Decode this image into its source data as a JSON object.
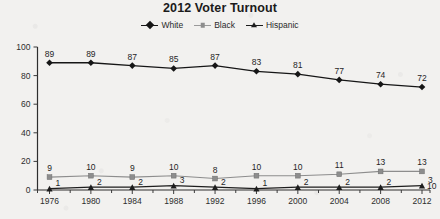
{
  "chart_data": {
    "type": "line",
    "title": "2012 Voter Turnout",
    "xlabel": "",
    "ylabel": "",
    "ylim": [
      0,
      100
    ],
    "yticks": [
      0,
      20,
      40,
      60,
      80,
      100
    ],
    "grid": false,
    "legend_position": "top-center",
    "categories": [
      "1976",
      "1980",
      "1984",
      "1988",
      "1992",
      "1996",
      "2000",
      "2004",
      "2008",
      "2012"
    ],
    "series": [
      {
        "name": "White",
        "marker": "diamond",
        "color": "#161616",
        "values": [
          89,
          89,
          87,
          85,
          87,
          83,
          81,
          77,
          74,
          72
        ]
      },
      {
        "name": "Black",
        "marker": "square",
        "color": "#8d8d8d",
        "values": [
          9,
          10,
          9,
          10,
          8,
          10,
          10,
          11,
          13,
          13
        ]
      },
      {
        "name": "Hispanic",
        "marker": "triangle",
        "color": "#1d1d1d",
        "values": [
          1,
          2,
          2,
          3,
          2,
          1,
          2,
          2,
          2,
          3
        ],
        "end_label": "10"
      }
    ]
  },
  "legend": {
    "items": [
      {
        "label": "White"
      },
      {
        "label": "Black"
      },
      {
        "label": "Hispanic"
      }
    ]
  }
}
